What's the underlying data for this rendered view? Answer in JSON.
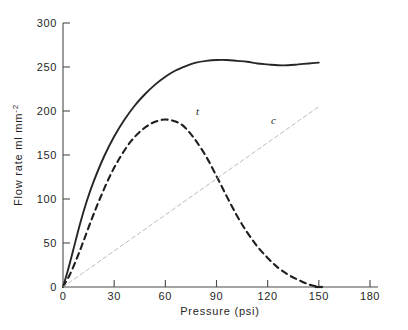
{
  "chart_data": {
    "type": "line",
    "title": "",
    "xlabel": "Pressure  (psi)",
    "ylabel": "Flow rate ml mm",
    "ylabel_sup": "-2",
    "xlim": [
      0,
      180
    ],
    "ylim": [
      0,
      300
    ],
    "xticks": [
      0,
      30,
      60,
      90,
      120,
      150,
      180
    ],
    "xtick_labels": [
      "0",
      "30",
      "60",
      "90",
      "120",
      "150",
      "180"
    ],
    "yticks": [
      0,
      50,
      100,
      150,
      200,
      250,
      300
    ],
    "ytick_labels": [
      "0",
      "50",
      "100",
      "150",
      "200",
      "250",
      "300"
    ],
    "grid": false,
    "legend_position": "inline-annotations",
    "series": [
      {
        "name": "total-flow-solid",
        "style": "solid",
        "color": "#262626",
        "label": "",
        "x": [
          0,
          3,
          6,
          10,
          14,
          18,
          24,
          30,
          36,
          42,
          48,
          54,
          60,
          66,
          72,
          78,
          84,
          90,
          96,
          102,
          108,
          114,
          120,
          126,
          132,
          138,
          144,
          150
        ],
        "y": [
          0,
          20,
          42,
          72,
          98,
          120,
          148,
          171,
          190,
          206,
          219,
          230,
          239,
          246,
          251,
          255,
          257,
          258,
          258,
          257,
          256,
          254,
          253,
          252,
          252,
          253,
          254,
          255
        ]
      },
      {
        "name": "turbulent-flow-dashed",
        "style": "dashed",
        "color": "#1f1f1f",
        "label": "t",
        "label_x": 78,
        "label_y": 196,
        "x": [
          0,
          4,
          8,
          12,
          17,
          22,
          28,
          34,
          40,
          46,
          52,
          58,
          62,
          66,
          70,
          74,
          78,
          84,
          90,
          96,
          102,
          108,
          114,
          120,
          126,
          132,
          138,
          144,
          150
        ],
        "y": [
          0,
          14,
          32,
          52,
          78,
          102,
          128,
          149,
          166,
          178,
          186,
          190,
          190,
          188,
          184,
          176,
          166,
          148,
          126,
          103,
          81,
          62,
          46,
          33,
          22,
          14,
          8,
          3,
          0
        ]
      },
      {
        "name": "capillary-flow-line",
        "style": "dashed-light",
        "color": "#b4b4b4",
        "label": "c",
        "label_x": 122,
        "label_y": 185,
        "x": [
          0,
          150
        ],
        "y": [
          0,
          205
        ]
      }
    ]
  },
  "axes": {
    "y_axis_name": "y-axis",
    "x_axis_name": "x-axis"
  }
}
